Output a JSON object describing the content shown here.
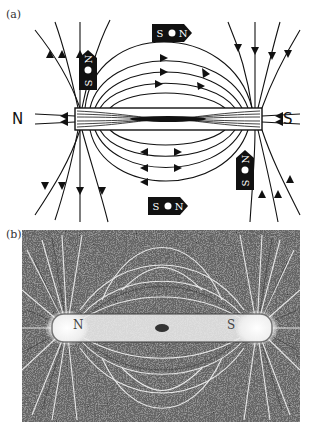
{
  "figure": {
    "panel_a": {
      "label": "(a)",
      "description": "Magnetic field lines around a bar magnet with compass needles",
      "magnet": {
        "left_pole": "N",
        "right_pole": "S"
      },
      "compasses": [
        {
          "position": "upper-left",
          "orientation": "vertical",
          "labels": [
            "S",
            "N"
          ]
        },
        {
          "position": "top-center",
          "orientation": "horizontal",
          "labels": [
            "S",
            "N"
          ]
        },
        {
          "position": "bottom-center",
          "orientation": "horizontal",
          "labels": [
            "S",
            "N"
          ]
        },
        {
          "position": "lower-right",
          "orientation": "vertical",
          "labels": [
            "S",
            "N"
          ]
        }
      ]
    },
    "panel_b": {
      "label": "(b)",
      "description": "Iron filings pattern around a bar magnet",
      "magnet": {
        "left_pole": "N",
        "right_pole": "S"
      }
    }
  },
  "colors": {
    "ink": "#111111",
    "paper": "#ffffff",
    "filings_bg": "#d8d8d8"
  }
}
